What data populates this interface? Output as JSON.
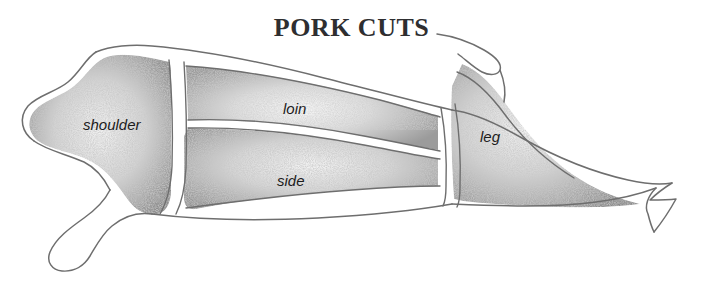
{
  "diagram": {
    "title": "PORK CUTS",
    "style": "pencil-sketch-stipple",
    "background_color": "#ffffff",
    "outline_color": "#6a6a6a",
    "title_color": "#2e2e30",
    "label_color": "#1c1c1c",
    "fill_light": "#e8e8e8",
    "fill_mid": "#c4c4c4",
    "fill_dark": "#9a9a9a"
  },
  "cuts": [
    {
      "id": "shoulder",
      "label": "shoulder"
    },
    {
      "id": "loin",
      "label": "loin"
    },
    {
      "id": "side",
      "label": "side"
    },
    {
      "id": "leg",
      "label": "leg"
    }
  ]
}
